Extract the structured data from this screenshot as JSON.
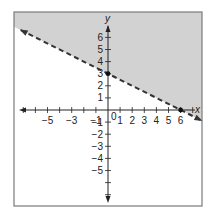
{
  "chart_data": {
    "type": "line",
    "title": "",
    "xlabel": "x",
    "ylabel": "y",
    "xlim": [
      -7.5,
      8
    ],
    "ylim": [
      -8,
      8
    ],
    "grid": false,
    "x_ticks": [
      -6,
      -5,
      -4,
      -3,
      -2,
      -1,
      1,
      2,
      3,
      4,
      5,
      6
    ],
    "x_tick_labels": [
      "-5",
      "-3",
      "-1",
      "1",
      "2",
      "3",
      "4",
      "5",
      "6"
    ],
    "y_tick_labels": [
      "6",
      "5",
      "4",
      "3",
      "2",
      "1",
      "-1",
      "-2",
      "-3",
      "-4",
      "-5"
    ],
    "origin_label": "0",
    "series": [
      {
        "name": "boundary line y = -x/2 + 3",
        "style": "dashed",
        "slope": -0.5,
        "intercept": 3,
        "x": [
          -7.5,
          0,
          6,
          8
        ],
        "y": [
          6.75,
          3,
          0,
          -1
        ]
      }
    ],
    "points": [
      {
        "label": "y-intercept",
        "x": 0,
        "y": 3
      },
      {
        "label": "x-intercept",
        "x": 6,
        "y": 0
      }
    ],
    "shaded_region": "above line (y > -x/2 + 3)",
    "colors": {
      "shade": "#d2d2d2",
      "line": "#333333",
      "frame": "#7a7a7a",
      "axis": "#222222"
    }
  }
}
